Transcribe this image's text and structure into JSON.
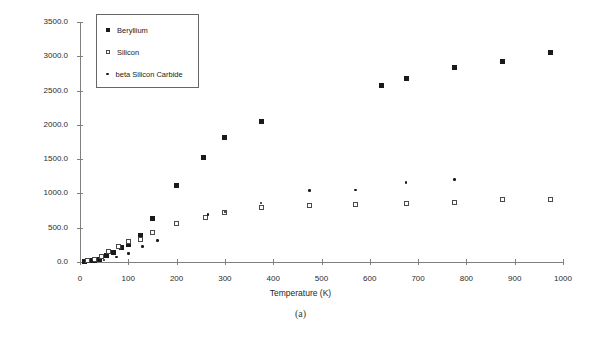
{
  "caption": "(a)",
  "legend": {
    "position": "top-left-inside",
    "entries": [
      {
        "label": "Beryllium",
        "marker": "filled-square"
      },
      {
        "label": "Silicon",
        "marker": "open-square"
      },
      {
        "label": "beta Silicon Carbide",
        "marker": "filled-dot"
      }
    ]
  },
  "chart_data": {
    "type": "scatter",
    "title": "",
    "xlabel": "Temperature (K)",
    "ylabel": "Specific Heat (J/kg K)",
    "xlim": [
      0,
      1000
    ],
    "ylim": [
      0,
      3500
    ],
    "xticks": [
      0,
      100,
      200,
      300,
      400,
      500,
      600,
      700,
      800,
      900,
      1000
    ],
    "xticklabels": [
      "0",
      "100",
      "200",
      "300",
      "400",
      "500",
      "600",
      "700",
      "800",
      "900",
      "1000"
    ],
    "yticks": [
      0,
      500,
      1000,
      1500,
      2000,
      2500,
      3000,
      3500
    ],
    "yticklabels": [
      "0.0",
      "500.0",
      "1000.0",
      "1500.0",
      "2000.0",
      "2500.0",
      "3000.0",
      "3500.0"
    ],
    "grid": false,
    "series": [
      {
        "name": "Beryllium",
        "marker": "filled-square",
        "color": "#1a1a1a",
        "points": [
          [
            10,
            10
          ],
          [
            20,
            15
          ],
          [
            30,
            25
          ],
          [
            40,
            40
          ],
          [
            55,
            90
          ],
          [
            70,
            140
          ],
          [
            85,
            210
          ],
          [
            100,
            250
          ],
          [
            125,
            390
          ],
          [
            150,
            640
          ],
          [
            200,
            1120
          ],
          [
            255,
            1530
          ],
          [
            300,
            1820
          ],
          [
            375,
            2050
          ],
          [
            625,
            2580
          ],
          [
            675,
            2670
          ],
          [
            775,
            2830
          ],
          [
            875,
            2920
          ],
          [
            975,
            3050
          ]
        ]
      },
      {
        "name": "Silicon",
        "marker": "open-square",
        "color": "#4a4a4a",
        "points": [
          [
            15,
            20
          ],
          [
            30,
            40
          ],
          [
            45,
            80
          ],
          [
            60,
            150
          ],
          [
            80,
            230
          ],
          [
            100,
            300
          ],
          [
            125,
            330
          ],
          [
            150,
            430
          ],
          [
            200,
            560
          ],
          [
            260,
            650
          ],
          [
            300,
            720
          ],
          [
            375,
            790
          ],
          [
            475,
            830
          ],
          [
            570,
            845
          ],
          [
            675,
            860
          ],
          [
            775,
            875
          ],
          [
            875,
            905
          ],
          [
            975,
            915
          ]
        ]
      },
      {
        "name": "beta Silicon Carbide",
        "marker": "filled-dot",
        "color": "#1a1a1a",
        "points": [
          [
            25,
            15
          ],
          [
            50,
            30
          ],
          [
            75,
            70
          ],
          [
            100,
            120
          ],
          [
            130,
            230
          ],
          [
            160,
            310
          ],
          [
            265,
            690
          ],
          [
            300,
            730
          ],
          [
            375,
            860
          ],
          [
            475,
            1040
          ],
          [
            570,
            1050
          ],
          [
            675,
            1160
          ],
          [
            775,
            1200
          ]
        ]
      }
    ]
  }
}
